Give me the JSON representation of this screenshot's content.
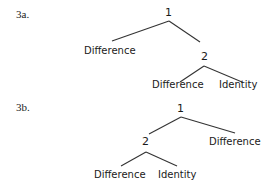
{
  "figures": [
    {
      "label": "3a.",
      "root": "1",
      "left_leaf": "Difference",
      "subtree_root": "2",
      "subtree_left": "Difference",
      "subtree_right": "Identity"
    },
    {
      "label": "3b.",
      "root": "1",
      "subtree_root": "2",
      "right_leaf": "Difference",
      "subtree_left": "Difference",
      "subtree_right": "Identity"
    }
  ]
}
